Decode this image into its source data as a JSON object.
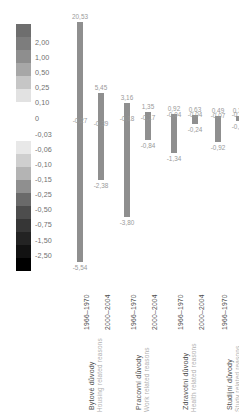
{
  "legend": {
    "name": "color-scale-legend",
    "labels": [
      "2,00",
      "1,00",
      "0,50",
      "0,25",
      "0,10",
      "0",
      "-0,03",
      "-0,06",
      "-0,10",
      "-0,15",
      "-0,25",
      "-0,50",
      "-0,75",
      "-1,50",
      "-2,50"
    ],
    "colors": [
      "#6e6e6e",
      "#7d7d7d",
      "#8e8e8e",
      "#a7a7a7",
      "#c6c6c6",
      "#e2e2e2",
      "#ffffff",
      "#ffffff",
      "#ffffff",
      "#e8e8e8",
      "#cfcfcf",
      "#b4b4b4",
      "#8f8f8f",
      "#6a6a6a",
      "#4d4d4d",
      "#363636",
      "#232323",
      "#121212",
      "#000000"
    ]
  },
  "chart_data": {
    "type": "bar",
    "title": "",
    "xlabel": "",
    "ylabel": "",
    "bar_color": "#8f8f8f",
    "grid": false,
    "legend_position": "left",
    "groups": [
      {
        "cz": "Bytové důvody",
        "en": "Housing related reasons",
        "bars": [
          {
            "period": "1966–1970",
            "top": "20,53",
            "inner": "-0,27",
            "bottom": "-5,54",
            "top_value": 20.53,
            "inner_value": -0.27,
            "bottom_value": -5.54
          },
          {
            "period": "2000–2004",
            "top": "5,45",
            "inner": "-0,39",
            "bottom": "-2,38",
            "top_value": 5.45,
            "inner_value": -0.39,
            "bottom_value": -2.38
          }
        ]
      },
      {
        "cz": "Pracovní důvody",
        "en": "Work related reasons",
        "bars": [
          {
            "period": "1966–1970",
            "top": "3,16",
            "inner": "-0,18",
            "bottom": "-3,80",
            "top_value": 3.16,
            "inner_value": -0.18,
            "bottom_value": -3.8
          },
          {
            "period": "2000–2004",
            "top": "1,35",
            "inner": "-0,17",
            "bottom": "-0,84",
            "top_value": 1.35,
            "inner_value": -0.17,
            "bottom_value": -0.84
          }
        ]
      },
      {
        "cz": "Zdravotní důvody",
        "en": "Health related reasons",
        "bars": [
          {
            "period": "1966–1970",
            "top": "0,92",
            "inner": "-0,04",
            "bottom": "-1,34",
            "top_value": 0.92,
            "inner_value": -0.04,
            "bottom_value": -1.34
          },
          {
            "period": "2000–2004",
            "top": "0,63",
            "inner": "-0,04",
            "bottom": "-0,24",
            "top_value": 0.63,
            "inner_value": -0.04,
            "bottom_value": -0.24
          }
        ]
      },
      {
        "cz": "Studijní důvody",
        "en": "Study related reasons",
        "bars": [
          {
            "period": "1966–1970",
            "top": "0,49",
            "inner": "-0,07",
            "bottom": "-0,92",
            "top_value": 0.49,
            "inner_value": -0.07,
            "bottom_value": -0.92
          },
          {
            "period": "2000–2004",
            "top": "0,38",
            "inner": "-0,03",
            "bottom": "-0,13",
            "top_value": 0.38,
            "inner_value": -0.03,
            "bottom_value": -0.13
          }
        ]
      }
    ]
  }
}
